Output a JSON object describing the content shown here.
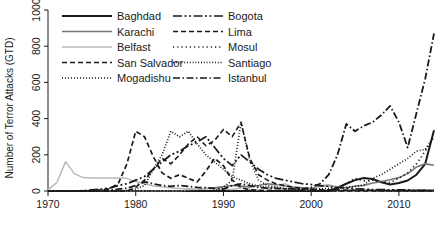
{
  "chart_data": {
    "type": "line",
    "title": "",
    "xlabel": "",
    "ylabel": "Number of Terror Attacks (GTD)",
    "xlim": [
      1970,
      2014
    ],
    "ylim": [
      0,
      1000
    ],
    "xticks": [
      "1970",
      "1980",
      "1990",
      "2000",
      "2010"
    ],
    "xtick_values": [
      1970,
      1980,
      1990,
      2000,
      2010
    ],
    "yticks": [
      "0",
      "200",
      "400",
      "600",
      "800",
      "1000"
    ],
    "ytick_values": [
      0,
      200,
      400,
      600,
      800,
      1000
    ],
    "grid": false,
    "legend_position": "top",
    "x": [
      1970,
      1971,
      1972,
      1973,
      1974,
      1975,
      1976,
      1977,
      1978,
      1979,
      1980,
      1981,
      1982,
      1983,
      1984,
      1985,
      1986,
      1987,
      1988,
      1989,
      1990,
      1991,
      1992,
      1993,
      1994,
      1995,
      1996,
      1997,
      1998,
      1999,
      2000,
      2001,
      2002,
      2003,
      2004,
      2005,
      2006,
      2007,
      2008,
      2009,
      2010,
      2011,
      2012,
      2013,
      2014
    ],
    "series": [
      {
        "name": "Baghdad",
        "style": "solid",
        "color": "#1a1a1a",
        "width": 2.0,
        "values": [
          0,
          0,
          0,
          0,
          0,
          0,
          0,
          0,
          0,
          0,
          0,
          0,
          0,
          0,
          0,
          0,
          0,
          0,
          0,
          0,
          0,
          0,
          0,
          0,
          0,
          0,
          0,
          0,
          0,
          0,
          0,
          0,
          0,
          18,
          40,
          60,
          72,
          66,
          48,
          36,
          44,
          58,
          90,
          150,
          335
        ]
      },
      {
        "name": "Karachi",
        "style": "solid",
        "color": "#777777",
        "width": 1.6,
        "values": [
          0,
          0,
          0,
          0,
          0,
          0,
          0,
          0,
          0,
          0,
          0,
          0,
          0,
          0,
          0,
          0,
          4,
          8,
          14,
          18,
          24,
          30,
          28,
          22,
          30,
          40,
          34,
          28,
          22,
          18,
          14,
          26,
          30,
          22,
          18,
          26,
          30,
          44,
          52,
          62,
          74,
          96,
          132,
          150,
          142
        ]
      },
      {
        "name": "Belfast",
        "style": "solid",
        "color": "#b9b9b9",
        "width": 1.5,
        "values": [
          8,
          46,
          162,
          96,
          74,
          72,
          72,
          72,
          72,
          70,
          52,
          40,
          28,
          22,
          18,
          14,
          12,
          10,
          14,
          12,
          10,
          8,
          18,
          10,
          6,
          4,
          26,
          40,
          18,
          8,
          6,
          30,
          34,
          22,
          10,
          6,
          4,
          4,
          2,
          2,
          4,
          6,
          4,
          6,
          4
        ]
      },
      {
        "name": "San Salvador",
        "style": "dashed",
        "color": "#1a1a1a",
        "width": 1.7,
        "values": [
          0,
          0,
          0,
          0,
          0,
          2,
          6,
          12,
          40,
          150,
          330,
          300,
          190,
          100,
          70,
          90,
          70,
          50,
          110,
          180,
          140,
          60,
          20,
          6,
          4,
          2,
          2,
          2,
          2,
          2,
          0,
          0,
          0,
          0,
          0,
          0,
          0,
          0,
          0,
          0,
          0,
          0,
          0,
          0,
          0
        ]
      },
      {
        "name": "Mogadishu",
        "style": "dotted",
        "color": "#1a1a1a",
        "width": 1.7,
        "values": [
          0,
          0,
          0,
          0,
          0,
          0,
          0,
          0,
          0,
          0,
          0,
          0,
          0,
          0,
          0,
          0,
          0,
          0,
          0,
          4,
          20,
          60,
          380,
          170,
          60,
          30,
          20,
          14,
          10,
          8,
          10,
          12,
          14,
          16,
          20,
          26,
          34,
          70,
          90,
          120,
          150,
          180,
          220,
          230,
          300
        ]
      },
      {
        "name": "Bogota",
        "style": "longdashdot",
        "color": "#1a1a1a",
        "width": 1.7,
        "values": [
          0,
          0,
          0,
          0,
          2,
          6,
          10,
          16,
          30,
          40,
          60,
          80,
          120,
          160,
          200,
          220,
          250,
          270,
          300,
          240,
          180,
          140,
          200,
          160,
          120,
          90,
          70,
          60,
          50,
          40,
          36,
          30,
          26,
          20,
          16,
          12,
          10,
          8,
          8,
          6,
          6,
          6,
          4,
          4,
          4
        ]
      },
      {
        "name": "Lima",
        "style": "dashed",
        "color": "#1a1a1a",
        "width": 1.6,
        "values": [
          0,
          0,
          0,
          0,
          0,
          0,
          0,
          0,
          0,
          0,
          20,
          60,
          120,
          180,
          150,
          200,
          260,
          300,
          250,
          280,
          340,
          300,
          380,
          180,
          90,
          60,
          40,
          30,
          20,
          14,
          10,
          8,
          6,
          6,
          4,
          4,
          4,
          4,
          2,
          2,
          2,
          2,
          2,
          2,
          2
        ]
      },
      {
        "name": "Mosul",
        "style": "dotted-wide",
        "color": "#1a1a1a",
        "width": 1.7,
        "values": [
          0,
          0,
          0,
          0,
          0,
          0,
          0,
          0,
          0,
          0,
          0,
          0,
          0,
          0,
          0,
          0,
          0,
          0,
          0,
          0,
          0,
          0,
          0,
          0,
          0,
          0,
          0,
          0,
          0,
          0,
          0,
          0,
          0,
          14,
          40,
          70,
          56,
          60,
          50,
          46,
          70,
          100,
          150,
          220,
          300
        ]
      },
      {
        "name": "Santiago",
        "style": "dotted-fine",
        "color": "#1a1a1a",
        "width": 1.7,
        "values": [
          0,
          0,
          0,
          0,
          0,
          0,
          0,
          0,
          0,
          4,
          10,
          30,
          120,
          200,
          330,
          300,
          330,
          260,
          200,
          160,
          120,
          80,
          60,
          40,
          26,
          20,
          16,
          12,
          10,
          8,
          6,
          6,
          4,
          4,
          4,
          4,
          4,
          4,
          2,
          2,
          2,
          2,
          2,
          2,
          2
        ]
      },
      {
        "name": "Istanbul",
        "style": "dashdot",
        "color": "#1a1a1a",
        "width": 1.8,
        "values": [
          0,
          0,
          0,
          0,
          0,
          0,
          2,
          6,
          10,
          16,
          30,
          50,
          40,
          30,
          26,
          30,
          26,
          20,
          18,
          14,
          10,
          30,
          40,
          30,
          20,
          16,
          14,
          12,
          14,
          10,
          20,
          40,
          90,
          200,
          370,
          330,
          360,
          380,
          420,
          470,
          380,
          240,
          430,
          620,
          870
        ]
      }
    ]
  },
  "legend": {
    "column_left": [
      {
        "label": "Baghdad",
        "style": "solid",
        "color": "#1a1a1a"
      },
      {
        "label": "Karachi",
        "style": "solid",
        "color": "#777777"
      },
      {
        "label": "Belfast",
        "style": "solid",
        "color": "#b9b9b9"
      },
      {
        "label": "San Salvador",
        "style": "dashed",
        "color": "#1a1a1a"
      },
      {
        "label": "Mogadishu",
        "style": "dotted",
        "color": "#1a1a1a"
      }
    ],
    "column_right": [
      {
        "label": "Bogota",
        "style": "longdashdot",
        "color": "#1a1a1a"
      },
      {
        "label": "Lima",
        "style": "dashed",
        "color": "#1a1a1a"
      },
      {
        "label": "Mosul",
        "style": "dotted-wide",
        "color": "#1a1a1a"
      },
      {
        "label": "Santiago",
        "style": "dotted-fine",
        "color": "#1a1a1a"
      },
      {
        "label": "Istanbul",
        "style": "dashdot",
        "color": "#1a1a1a"
      }
    ]
  },
  "caption": {
    "text": ""
  }
}
